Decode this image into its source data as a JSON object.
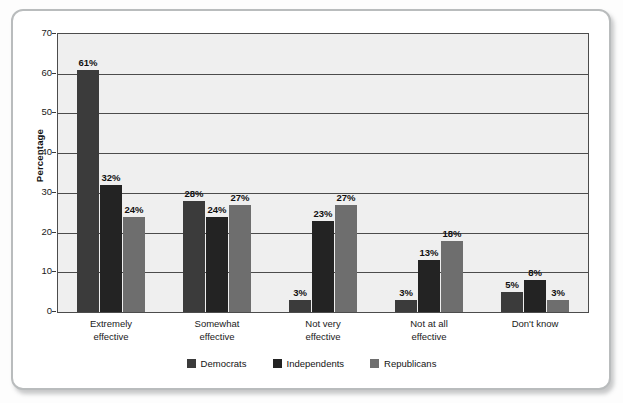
{
  "chart_data": {
    "type": "bar",
    "title": "",
    "xlabel": "",
    "ylabel": "Percentage",
    "ylim": [
      0,
      70
    ],
    "yticks": [
      0,
      10,
      20,
      30,
      40,
      50,
      60,
      70
    ],
    "grid": true,
    "legend_position": "bottom",
    "categories": [
      "Extremely effective",
      "Somewhat effective",
      "Not very effective",
      "Not at all effective",
      "Don't know"
    ],
    "category_lines": [
      [
        "Extremely",
        "effective"
      ],
      [
        "Somewhat",
        "effective"
      ],
      [
        "Not very",
        "effective"
      ],
      [
        "Not at all",
        "effective"
      ],
      [
        "Don't know",
        ""
      ]
    ],
    "series": [
      {
        "name": "Democrats",
        "color": "#3b3b3b",
        "values": [
          61,
          28,
          3,
          3,
          5
        ],
        "labels": [
          "61%",
          "28%",
          "3%",
          "3%",
          "5%"
        ]
      },
      {
        "name": "Independents",
        "color": "#232323",
        "values": [
          32,
          24,
          23,
          13,
          8
        ],
        "labels": [
          "32%",
          "24%",
          "23%",
          "13%",
          "8%"
        ]
      },
      {
        "name": "Republicans",
        "color": "#6e6e6e",
        "values": [
          24,
          27,
          27,
          18,
          3
        ],
        "labels": [
          "24%",
          "27%",
          "27%",
          "18%",
          "3%"
        ]
      }
    ]
  },
  "axis": {
    "ytick_labels": [
      "70",
      "60",
      "50",
      "40",
      "30",
      "20",
      "10",
      "0"
    ],
    "ylabel": "Percentage"
  },
  "legend": {
    "items": [
      {
        "label": "Democrats",
        "color": "#3b3b3b"
      },
      {
        "label": "Independents",
        "color": "#232323"
      },
      {
        "label": "Republicans",
        "color": "#6e6e6e"
      }
    ]
  },
  "colors": {
    "plot_background": "#efefef",
    "gridline": "#4c4c4c",
    "frame_border": "#b9bcbd",
    "page_background": "#fdfdfd"
  }
}
